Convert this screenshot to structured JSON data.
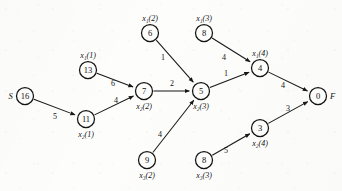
{
  "diagram": {
    "type": "directed-weighted-graph",
    "title": "",
    "source_label": "S",
    "sink_label": "F",
    "nodes": [
      {
        "id": "S",
        "value": "16",
        "tag": "",
        "side_label": "S",
        "side": "left",
        "cx": 25,
        "cy": 96,
        "r": 8.5
      },
      {
        "id": "n13",
        "value": "13",
        "tag": "x₁(1)",
        "side_label": "",
        "side": "above",
        "cx": 88,
        "cy": 70,
        "r": 8.5
      },
      {
        "id": "n11",
        "value": "11",
        "tag": "x₂(1)",
        "side_label": "",
        "side": "below",
        "cx": 86,
        "cy": 119,
        "r": 8.5
      },
      {
        "id": "n6",
        "value": "6",
        "tag": "x₁(2)",
        "side_label": "",
        "side": "above",
        "cx": 150,
        "cy": 33,
        "r": 8.5
      },
      {
        "id": "n7",
        "value": "7",
        "tag": "x₂(2)",
        "side_label": "",
        "side": "below",
        "cx": 144,
        "cy": 91,
        "r": 8.5
      },
      {
        "id": "n9",
        "value": "9",
        "tag": "x₃(2)",
        "side_label": "",
        "side": "below",
        "cx": 147,
        "cy": 160,
        "r": 8.5
      },
      {
        "id": "n8a",
        "value": "8",
        "tag": "x₁(3)",
        "side_label": "",
        "side": "above",
        "cx": 204,
        "cy": 33,
        "r": 8.5
      },
      {
        "id": "n5",
        "value": "5",
        "tag": "x₂(3)",
        "side_label": "",
        "side": "below",
        "cx": 201,
        "cy": 91,
        "r": 8.5
      },
      {
        "id": "n8b",
        "value": "8",
        "tag": "x₃(3)",
        "side_label": "",
        "side": "below",
        "cx": 204,
        "cy": 160,
        "r": 8.5
      },
      {
        "id": "n4",
        "value": "4",
        "tag": "x₁(4)",
        "side_label": "",
        "side": "above",
        "cx": 260,
        "cy": 68,
        "r": 8.5
      },
      {
        "id": "n3",
        "value": "3",
        "tag": "x₂(4)",
        "side_label": "",
        "side": "below",
        "cx": 260,
        "cy": 128,
        "r": 8.5
      },
      {
        "id": "F",
        "value": "0",
        "tag": "",
        "side_label": "F",
        "side": "right",
        "cx": 318,
        "cy": 96,
        "r": 8.5
      }
    ],
    "edges": [
      {
        "from": "S",
        "to": "n11",
        "weight": "5",
        "lx": 55,
        "ly": 116
      },
      {
        "from": "n13",
        "to": "n7",
        "weight": "6",
        "lx": 113,
        "ly": 83
      },
      {
        "from": "n11",
        "to": "n7",
        "weight": "4",
        "lx": 116,
        "ly": 100
      },
      {
        "from": "n6",
        "to": "n5",
        "weight": "1",
        "lx": 163,
        "ly": 57
      },
      {
        "from": "n7",
        "to": "n5",
        "weight": "2",
        "lx": 172,
        "ly": 83
      },
      {
        "from": "n9",
        "to": "n5",
        "weight": "4",
        "lx": 160,
        "ly": 134
      },
      {
        "from": "n8a",
        "to": "n4",
        "weight": "4",
        "lx": 224,
        "ly": 57
      },
      {
        "from": "n5",
        "to": "n4",
        "weight": "1",
        "lx": 226,
        "ly": 73
      },
      {
        "from": "n8b",
        "to": "n3",
        "weight": "5",
        "lx": 226,
        "ly": 150
      },
      {
        "from": "n4",
        "to": "F",
        "weight": "4",
        "lx": 283,
        "ly": 85
      },
      {
        "from": "n3",
        "to": "F",
        "weight": "3",
        "lx": 288,
        "ly": 108
      }
    ]
  },
  "chart_data": {
    "type": "diagram",
    "title": "",
    "nodes": [
      "S=16",
      "x1(1)=13",
      "x2(1)=11",
      "x1(2)=6",
      "x2(2)=7",
      "x3(2)=9",
      "x1(3)=8",
      "x2(3)=5",
      "x3(3)=8",
      "x1(4)=4",
      "x2(4)=3",
      "F=0"
    ],
    "edges": [
      {
        "source": "S",
        "target": "x2(1)",
        "weight": 5
      },
      {
        "source": "x1(1)",
        "target": "x2(2)",
        "weight": 6
      },
      {
        "source": "x2(1)",
        "target": "x2(2)",
        "weight": 4
      },
      {
        "source": "x1(2)",
        "target": "x2(3)",
        "weight": 1
      },
      {
        "source": "x2(2)",
        "target": "x2(3)",
        "weight": 2
      },
      {
        "source": "x3(2)",
        "target": "x2(3)",
        "weight": 4
      },
      {
        "source": "x1(3)",
        "target": "x1(4)",
        "weight": 4
      },
      {
        "source": "x2(3)",
        "target": "x1(4)",
        "weight": 1
      },
      {
        "source": "x3(3)",
        "target": "x2(4)",
        "weight": 5
      },
      {
        "source": "x1(4)",
        "target": "F",
        "weight": 4
      },
      {
        "source": "x2(4)",
        "target": "F",
        "weight": 3
      }
    ]
  }
}
